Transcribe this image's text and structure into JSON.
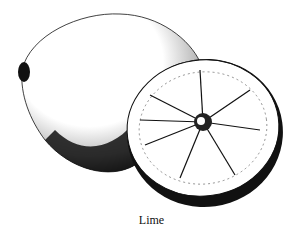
{
  "figure": {
    "caption": "Lime",
    "style": "black-and-white stipple engraving",
    "colors": {
      "ink": "#111111",
      "background": "#ffffff"
    }
  }
}
